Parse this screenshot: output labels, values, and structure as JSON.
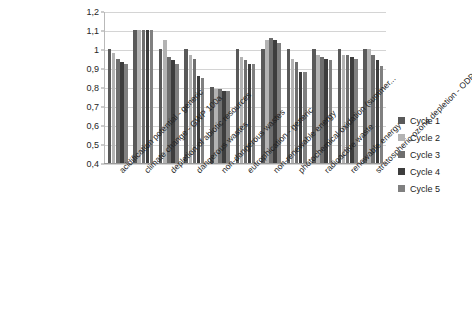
{
  "chart_data": {
    "type": "bar",
    "title": "",
    "subtitle": "",
    "xlabel": "",
    "ylabel": "",
    "ylim": [
      0.4,
      1.2
    ],
    "ytick_labels": [
      "1,2",
      "1,1",
      "1",
      "0,9",
      "0,8",
      "0,7",
      "0,6",
      "0,5",
      "0,4"
    ],
    "ytick_values": [
      1.2,
      1.1,
      1.0,
      0.9,
      0.8,
      0.7,
      0.6,
      0.5,
      0.4
    ],
    "grid": true,
    "legend_position": "right",
    "decimal_separator": ",",
    "categories": [
      "acidification potential - generic",
      "climate change - GWP 100a",
      "depletion of abiotic resources",
      "dangerous wastes",
      "non-dangerous wastes",
      "eutrophication - generic",
      "non-renewable energy",
      "photochemical oxidation (summer...",
      "radioactive waste",
      "renewable energy",
      "stratospheric ozone depletion - ODP ..."
    ],
    "series": [
      {
        "name": "Cycle 1",
        "color": "#595959",
        "values": [
          1.0,
          1.1,
          1.0,
          1.0,
          0.8,
          1.0,
          1.0,
          1.0,
          1.0,
          1.0,
          1.0
        ]
      },
      {
        "name": "Cycle 2",
        "color": "#b3b3b3",
        "values": [
          0.98,
          1.1,
          1.05,
          0.97,
          0.79,
          0.96,
          1.05,
          0.95,
          0.97,
          0.97,
          1.0
        ]
      },
      {
        "name": "Cycle 3",
        "color": "#6e6e6e",
        "values": [
          0.95,
          1.1,
          0.96,
          0.95,
          0.79,
          0.94,
          1.06,
          0.93,
          0.96,
          0.97,
          0.97
        ]
      },
      {
        "name": "Cycle 4",
        "color": "#3d3d3d",
        "values": [
          0.93,
          1.1,
          0.94,
          0.86,
          0.78,
          0.92,
          1.05,
          0.88,
          0.95,
          0.96,
          0.94
        ]
      },
      {
        "name": "Cycle 5",
        "color": "#808080",
        "values": [
          0.92,
          1.1,
          0.92,
          0.85,
          0.78,
          0.92,
          1.03,
          0.88,
          0.94,
          0.95,
          0.91
        ]
      }
    ]
  },
  "legend": {
    "items": [
      {
        "label": "Cycle 1"
      },
      {
        "label": "Cycle 2"
      },
      {
        "label": "Cycle 3"
      },
      {
        "label": "Cycle 4"
      },
      {
        "label": "Cycle 5"
      }
    ]
  }
}
